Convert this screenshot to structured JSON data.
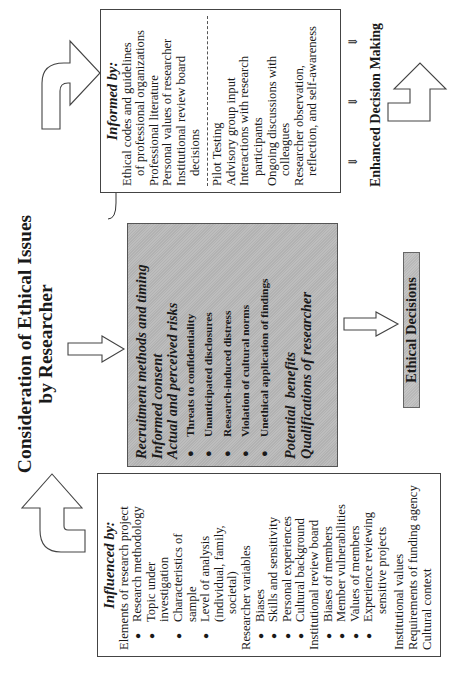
{
  "title": {
    "line1": "Consideration of Ethical Issues",
    "line2": "by Researcher"
  },
  "influenced_box": {
    "header": "Influenced by:",
    "groups": [
      {
        "label": "Elements of research project",
        "items": [
          {
            "line1": "Research methodology"
          },
          {
            "line1": "Topic under",
            "line2": "investigation"
          },
          {
            "line1": "Characteristics of",
            "line2": "sample"
          },
          {
            "line1": "Level of analysis",
            "line2": "(individual, family,",
            "line3": "societal)"
          }
        ]
      },
      {
        "label": "Researcher variables",
        "items": [
          {
            "line1": "Biases"
          },
          {
            "line1": "Skills and sensitivity"
          },
          {
            "line1": "Personal experiences"
          },
          {
            "line1": "Cultural background"
          }
        ]
      },
      {
        "label": "Institutional review board",
        "items": [
          {
            "line1": "Biases of members"
          },
          {
            "line1": "Member vulnerabilities"
          },
          {
            "line1": "Values of members"
          },
          {
            "line1": "Experience reviewing",
            "line2": "sensitive projects"
          }
        ]
      }
    ],
    "trailing": [
      "Institutional values",
      "Requirements of funding agency",
      "Cultural context"
    ]
  },
  "center_box": {
    "items_top": [
      "Recruitment methods and timing",
      "Informed consent",
      "Actual and perceived risks"
    ],
    "risks": [
      "Threats to confidentiality",
      "Unanticipated disclosures",
      "Research-induced distress",
      "Violation of cultural norms",
      "Unethical application of findings"
    ],
    "items_bottom": [
      "Potential  benefits",
      "Qualifications of researcher"
    ]
  },
  "informed_box": {
    "header": "Informed by:",
    "section1": [
      {
        "line1": "Ethical codes and guidelines",
        "line2": "of professional organizations"
      },
      {
        "line1": "Professional literature"
      },
      {
        "line1": "Personal values of researcher"
      },
      {
        "line1": "Institutional review board",
        "line2": "decisions"
      }
    ],
    "section2": [
      {
        "line1": "Pilot Testing"
      },
      {
        "line1": "Advisory group input"
      },
      {
        "line1": "Interactions with research",
        "line2": "participants"
      },
      {
        "line1": "Ongoing discussions with",
        "line2": "colleagues"
      },
      {
        "line1": "Researcher observation,",
        "line2": "reflection, and self-awareness"
      }
    ]
  },
  "outcomes": {
    "ethical_decisions": "Ethical Decisions",
    "enhanced_decision_making": "Enhanced Decision Making"
  },
  "glyphs": {
    "bullet": "●",
    "double_arrow": "⇓"
  },
  "colors": {
    "center_fill": "#bdbdbd",
    "border": "#444444",
    "text": "#1a1a1a"
  }
}
